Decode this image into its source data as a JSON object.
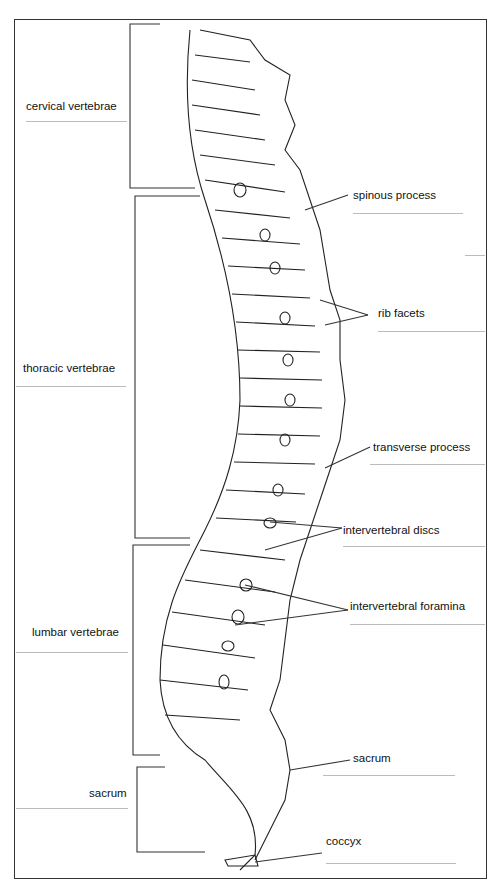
{
  "diagram": {
    "left_labels": [
      {
        "id": "cervical",
        "text": "cervical vertebrae"
      },
      {
        "id": "thoracic",
        "text": "thoracic vertebrae"
      },
      {
        "id": "lumbar",
        "text": "lumbar vertebrae"
      },
      {
        "id": "sacrum",
        "text": "sacrum"
      }
    ],
    "right_labels": [
      {
        "id": "spinous",
        "text": "spinous process"
      },
      {
        "id": "rib",
        "text": "rib facets"
      },
      {
        "id": "transverse",
        "text": "transverse process"
      },
      {
        "id": "discs",
        "text": "intervertebral discs"
      },
      {
        "id": "foramina",
        "text": "intervertebral foramina"
      },
      {
        "id": "sacrum_r",
        "text": "sacrum"
      },
      {
        "id": "coccyx",
        "text": "coccyx"
      }
    ],
    "colors": {
      "line": "#222222",
      "frame": "#333333",
      "underline": "#bbbbbb"
    }
  }
}
